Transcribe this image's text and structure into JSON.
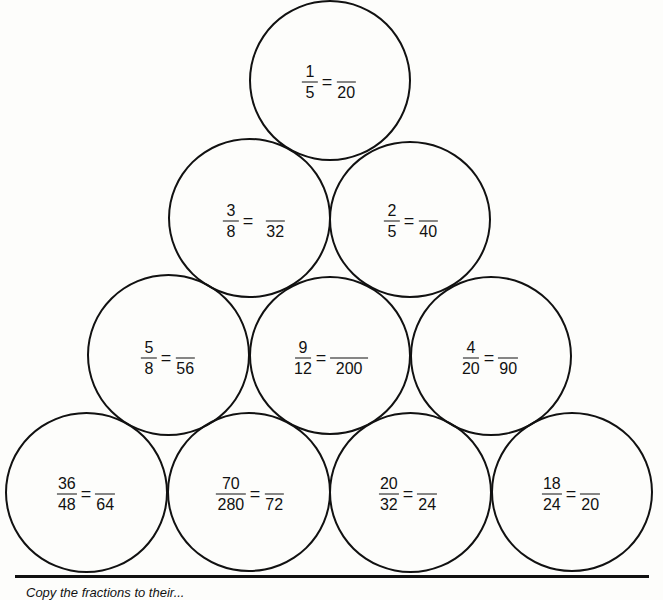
{
  "worksheet": {
    "title": "Equivalent fractions pyramid",
    "rows": [
      {
        "row": 1,
        "problems": [
          {
            "num": "1",
            "den": "5",
            "target_num": "",
            "target_den": "20"
          }
        ]
      },
      {
        "row": 2,
        "problems": [
          {
            "num": "3",
            "den": "8",
            "target_num": "",
            "target_den": "32"
          },
          {
            "num": "2",
            "den": "5",
            "target_num": "",
            "target_den": "40"
          }
        ]
      },
      {
        "row": 3,
        "problems": [
          {
            "num": "5",
            "den": "8",
            "target_num": "",
            "target_den": "56"
          },
          {
            "num": "9",
            "den": "12",
            "target_num": "",
            "target_den": "200"
          },
          {
            "num": "4",
            "den": "20",
            "target_num": "",
            "target_den": "90"
          }
        ]
      },
      {
        "row": 4,
        "problems": [
          {
            "num": "36",
            "den": "48",
            "target_num": "",
            "target_den": "64"
          },
          {
            "num": "70",
            "den": "280",
            "target_num": "",
            "target_den": "72"
          },
          {
            "num": "20",
            "den": "32",
            "target_num": "",
            "target_den": "24"
          },
          {
            "num": "18",
            "den": "24",
            "target_num": "",
            "target_den": "20"
          }
        ]
      }
    ],
    "equals_sign": "=",
    "footer_caption": "Copy the fractions to their..."
  },
  "colors": {
    "ink": "#111111",
    "paper": "#fdfdfb"
  }
}
